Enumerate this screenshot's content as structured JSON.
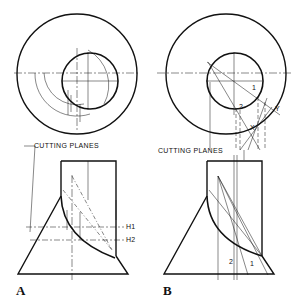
{
  "figure": {
    "panels": [
      {
        "id": "A",
        "label": "A",
        "callout": "CUTTING PLANES",
        "planes": [
          "H1",
          "H2"
        ]
      },
      {
        "id": "B",
        "label": "B",
        "callout": "CUTTING PLANES",
        "point_labels": [
          "1",
          "2",
          "X",
          "Y",
          "1",
          "2"
        ]
      }
    ]
  }
}
